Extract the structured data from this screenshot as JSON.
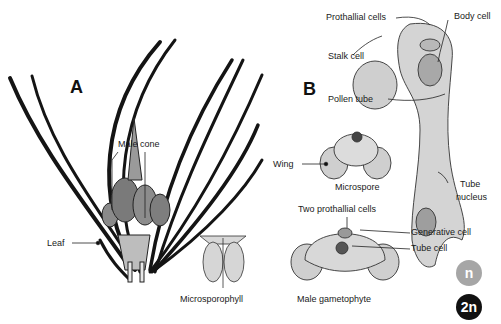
{
  "panels": {
    "a": {
      "letter": "A"
    },
    "b": {
      "letter": "B"
    }
  },
  "labels": {
    "male_cone": "Male cone",
    "leaf": "Leaf",
    "microsporophyll": "Microsporophyll",
    "prothallial_cells": "Prothallial cells",
    "body_cell": "Body cell",
    "stalk_cell": "Stalk cell",
    "pollen_tube": "Pollen tube",
    "wing": "Wing",
    "microspore": "Microspore",
    "tube_nucleus_line1": "Tube",
    "tube_nucleus_line2": "nucleus",
    "two_prothallial_cells": "Two prothallial cells",
    "generative_cell": "Generative cell",
    "tube_cell": "Tube cell",
    "male_gametophyte": "Male gametophyte"
  },
  "legend": {
    "haploid": {
      "text": "n",
      "color": "#a6a6a6"
    },
    "diploid": {
      "text": "2n",
      "color": "#111111"
    }
  }
}
